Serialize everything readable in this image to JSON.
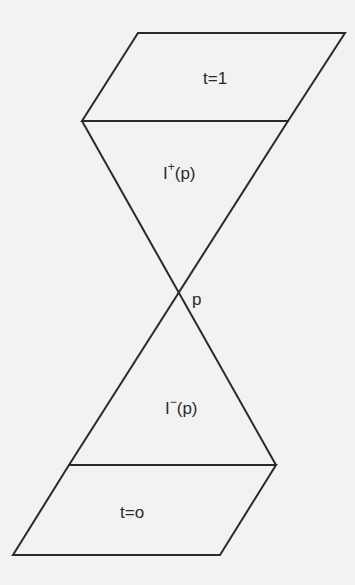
{
  "diagram": {
    "type": "light-cone",
    "colors": {
      "background": "#f2f2f2",
      "stroke": "#2a2a2a",
      "text": "#2a2a2a"
    },
    "labels": {
      "top_slice": "t=1",
      "future_cone": {
        "base": "I",
        "sup": "+",
        "arg": "(p)"
      },
      "apex": "p",
      "past_cone": {
        "base": "I",
        "sup": "−",
        "arg": "(p)"
      },
      "bottom_slice": "t=o"
    }
  }
}
